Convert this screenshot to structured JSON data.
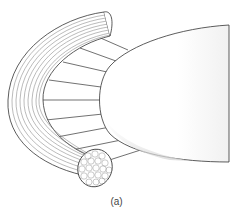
{
  "figure": {
    "caption": "(a)",
    "colors": {
      "stroke": "#333333",
      "fiber_line": "#777777",
      "fill": "#ffffff",
      "shade": "#e2e2e2"
    }
  }
}
